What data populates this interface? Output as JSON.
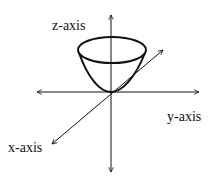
{
  "diagram": {
    "title": "",
    "type": "3D coordinate axes with paraboloid",
    "labels": {
      "z_axis": "z-axis",
      "y_axis": "y-axis",
      "x_axis": "x-axis"
    },
    "shape": "paraboloid (bowl opening upward, vertex at origin)",
    "colors": {
      "line": "#111111",
      "background": "#ffffff"
    }
  }
}
